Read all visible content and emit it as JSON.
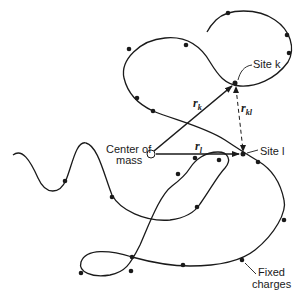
{
  "labels": {
    "center_of_mass_line1": "Center of",
    "center_of_mass_line2": "mass",
    "site_k": "Site k",
    "site_l": "Site l",
    "fixed_charges_line1": "Fixed",
    "fixed_charges_line2": "charges"
  },
  "vectors": {
    "r_k": {
      "symbol": "r",
      "subscript": "k"
    },
    "r_l": {
      "symbol": "r",
      "subscript": "l"
    },
    "r_kl": {
      "symbol": "r",
      "subscript": "kl"
    }
  },
  "colors": {
    "line": "#1a1a1a",
    "background": "#ffffff"
  }
}
